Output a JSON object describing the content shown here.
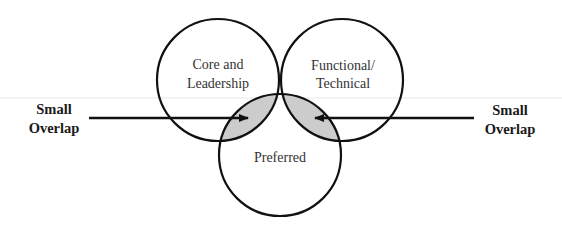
{
  "diagram": {
    "type": "venn",
    "sets": [
      {
        "id": "core",
        "label_lines": [
          "Core and",
          "Leadership"
        ]
      },
      {
        "id": "functional",
        "label_lines": [
          "Functional/",
          "Technical"
        ]
      },
      {
        "id": "preferred",
        "label_lines": [
          "Preferred"
        ]
      }
    ],
    "highlighted_overlaps": [
      {
        "sets": [
          "core",
          "preferred"
        ],
        "fill": "#cccccc"
      },
      {
        "sets": [
          "functional",
          "preferred"
        ],
        "fill": "#cccccc"
      }
    ],
    "annotations": {
      "left": {
        "lines": [
          "Small",
          "Overlap"
        ],
        "points_to": "core-preferred overlap"
      },
      "right": {
        "lines": [
          "Small",
          "Overlap"
        ],
        "points_to": "functional-preferred overlap"
      }
    },
    "colors": {
      "stroke": "#111111",
      "overlap_fill": "#cccccc",
      "rule": "#e6e6e6"
    }
  }
}
